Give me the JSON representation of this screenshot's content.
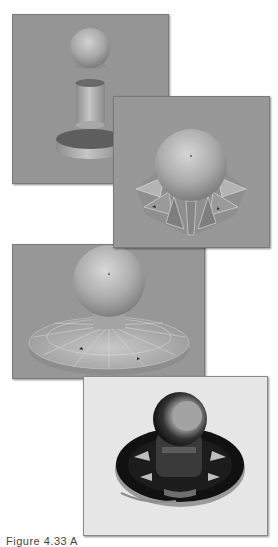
{
  "figure": {
    "caption": "Figure 4.33 A",
    "panels": [
      {
        "id": 1,
        "description": "Separate primitives: sphere, cylinder, and disc",
        "background": "#959595"
      },
      {
        "id": 2,
        "description": "Sphere merged with faceted flared skirt",
        "background": "#989898"
      },
      {
        "id": 3,
        "description": "Sphere with wide faceted disc base",
        "background": "#979797"
      },
      {
        "id": 4,
        "description": "Rendered glossy dark reflective final object",
        "background": "#e6e6e6"
      }
    ]
  }
}
